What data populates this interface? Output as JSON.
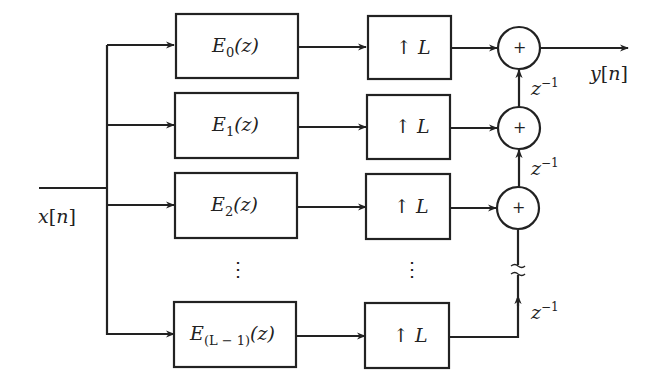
{
  "diagram": {
    "input": {
      "label": "x[n]",
      "var": "x",
      "index": "n"
    },
    "output": {
      "label": "y[n]",
      "var": "y",
      "index": "n"
    },
    "branches": [
      {
        "filter": {
          "base": "E",
          "sub": "0",
          "arg": "(z)"
        },
        "upsampler": {
          "arrow": "↑",
          "factor": "L"
        }
      },
      {
        "filter": {
          "base": "E",
          "sub": "1",
          "arg": "(z)"
        },
        "upsampler": {
          "arrow": "↑",
          "factor": "L"
        }
      },
      {
        "filter": {
          "base": "E",
          "sub": "2",
          "arg": "(z)"
        },
        "upsampler": {
          "arrow": "↑",
          "factor": "L"
        }
      },
      {
        "filter": {
          "base": "E",
          "sub": "(L − 1)",
          "arg": "(z)"
        },
        "upsampler": {
          "arrow": "↑",
          "factor": "L"
        }
      }
    ],
    "adders": [
      {
        "symbol": "+"
      },
      {
        "symbol": "+"
      },
      {
        "symbol": "+"
      }
    ],
    "delays": [
      {
        "base": "z",
        "exp": "−1"
      },
      {
        "base": "z",
        "exp": "−1"
      },
      {
        "base": "z",
        "exp": "−1"
      }
    ],
    "ellipsis": "⋮",
    "colors": {
      "stroke": "#222222",
      "background": "#ffffff"
    }
  }
}
